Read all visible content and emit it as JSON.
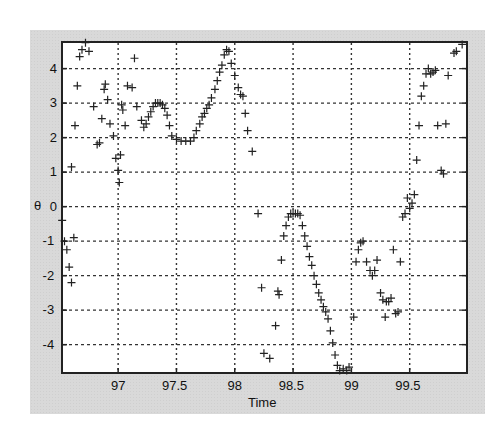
{
  "chart_data": {
    "type": "scatter",
    "title": "",
    "xlabel": "Time",
    "ylabel": "θ",
    "xlim": [
      96.51,
      100.0
    ],
    "ylim": [
      -4.85,
      4.8
    ],
    "xticks": [
      97,
      97.5,
      98,
      98.5,
      99,
      99.5
    ],
    "xtick_labels": [
      "97",
      "97.5",
      "98",
      "98.5",
      "99",
      "99.5"
    ],
    "yticks": [
      -4,
      -3,
      -2,
      -1,
      0,
      1,
      2,
      3,
      4
    ],
    "ytick_labels": [
      "-4",
      "-3",
      "-2",
      "-1",
      "0",
      "1",
      "2",
      "3",
      "4"
    ],
    "grid": true,
    "grid_style": "dotted",
    "marker": "+",
    "marker_color": "#222222",
    "legend": null,
    "series": [
      {
        "name": "theta",
        "points": [
          [
            96.52,
            -0.4
          ],
          [
            96.54,
            -1.0
          ],
          [
            96.56,
            -1.25
          ],
          [
            96.58,
            -1.75
          ],
          [
            96.6,
            -2.2
          ],
          [
            96.62,
            -0.9
          ],
          [
            96.6,
            1.15
          ],
          [
            96.63,
            2.35
          ],
          [
            96.65,
            3.5
          ],
          [
            96.67,
            4.35
          ],
          [
            96.69,
            4.55
          ],
          [
            96.72,
            4.75
          ],
          [
            96.75,
            4.5
          ],
          [
            96.79,
            2.9
          ],
          [
            96.82,
            1.8
          ],
          [
            96.84,
            1.85
          ],
          [
            96.86,
            2.55
          ],
          [
            96.88,
            3.4
          ],
          [
            96.89,
            3.55
          ],
          [
            96.91,
            3.1
          ],
          [
            96.93,
            2.4
          ],
          [
            96.96,
            2.05
          ],
          [
            96.98,
            1.4
          ],
          [
            97.0,
            1.05
          ],
          [
            97.01,
            0.7
          ],
          [
            97.02,
            1.5
          ],
          [
            97.03,
            2.95
          ],
          [
            97.04,
            2.8
          ],
          [
            97.06,
            2.35
          ],
          [
            97.08,
            3.5
          ],
          [
            97.12,
            3.45
          ],
          [
            97.14,
            4.3
          ],
          [
            97.16,
            2.9
          ],
          [
            97.2,
            2.5
          ],
          [
            97.22,
            2.3
          ],
          [
            97.24,
            2.4
          ],
          [
            97.26,
            2.6
          ],
          [
            97.28,
            2.75
          ],
          [
            97.3,
            2.9
          ],
          [
            97.32,
            3.0
          ],
          [
            97.34,
            3.0
          ],
          [
            97.36,
            3.0
          ],
          [
            97.38,
            2.95
          ],
          [
            97.4,
            2.85
          ],
          [
            97.42,
            2.65
          ],
          [
            97.44,
            2.35
          ],
          [
            97.46,
            2.05
          ],
          [
            97.5,
            1.95
          ],
          [
            97.54,
            1.9
          ],
          [
            97.58,
            1.9
          ],
          [
            97.62,
            1.9
          ],
          [
            97.65,
            2.0
          ],
          [
            97.67,
            2.2
          ],
          [
            97.7,
            2.4
          ],
          [
            97.72,
            2.6
          ],
          [
            97.74,
            2.7
          ],
          [
            97.76,
            2.85
          ],
          [
            97.78,
            2.95
          ],
          [
            97.8,
            3.15
          ],
          [
            97.83,
            3.4
          ],
          [
            97.85,
            3.65
          ],
          [
            97.87,
            3.9
          ],
          [
            97.89,
            4.1
          ],
          [
            97.91,
            4.4
          ],
          [
            97.93,
            4.55
          ],
          [
            97.95,
            4.5
          ],
          [
            97.97,
            4.15
          ],
          [
            98.0,
            3.8
          ],
          [
            98.03,
            3.45
          ],
          [
            98.05,
            3.25
          ],
          [
            98.07,
            3.2
          ],
          [
            98.09,
            2.7
          ],
          [
            98.11,
            2.2
          ],
          [
            98.15,
            1.6
          ],
          [
            98.2,
            -0.2
          ],
          [
            98.23,
            -2.35
          ],
          [
            98.25,
            -4.25
          ],
          [
            98.3,
            -4.4
          ],
          [
            98.35,
            -3.45
          ],
          [
            98.37,
            -2.45
          ],
          [
            98.38,
            -2.55
          ],
          [
            98.4,
            -1.55
          ],
          [
            98.42,
            -0.85
          ],
          [
            98.44,
            -0.55
          ],
          [
            98.46,
            -0.3
          ],
          [
            98.48,
            -0.2
          ],
          [
            98.5,
            -0.2
          ],
          [
            98.52,
            -0.2
          ],
          [
            98.54,
            -0.2
          ],
          [
            98.56,
            -0.25
          ],
          [
            98.58,
            -0.55
          ],
          [
            98.6,
            -0.85
          ],
          [
            98.62,
            -1.15
          ],
          [
            98.64,
            -1.45
          ],
          [
            98.66,
            -1.7
          ],
          [
            98.68,
            -2.0
          ],
          [
            98.7,
            -2.25
          ],
          [
            98.72,
            -2.5
          ],
          [
            98.74,
            -2.7
          ],
          [
            98.76,
            -2.9
          ],
          [
            98.78,
            -3.05
          ],
          [
            98.8,
            -3.25
          ],
          [
            98.82,
            -3.6
          ],
          [
            98.84,
            -3.95
          ],
          [
            98.86,
            -4.3
          ],
          [
            98.88,
            -4.6
          ],
          [
            98.9,
            -4.75
          ],
          [
            98.93,
            -4.7
          ],
          [
            98.96,
            -4.75
          ],
          [
            98.98,
            -4.65
          ],
          [
            99.02,
            -3.2
          ],
          [
            99.04,
            -1.6
          ],
          [
            99.06,
            -1.25
          ],
          [
            99.08,
            -1.05
          ],
          [
            99.1,
            -1.0
          ],
          [
            99.13,
            -1.6
          ],
          [
            99.16,
            -1.85
          ],
          [
            99.18,
            -2.0
          ],
          [
            99.2,
            -1.85
          ],
          [
            99.22,
            -1.55
          ],
          [
            99.25,
            -2.5
          ],
          [
            99.27,
            -2.7
          ],
          [
            99.29,
            -3.2
          ],
          [
            99.3,
            -2.75
          ],
          [
            99.32,
            -2.75
          ],
          [
            99.34,
            -2.65
          ],
          [
            99.36,
            -1.25
          ],
          [
            99.38,
            -3.1
          ],
          [
            99.4,
            -3.05
          ],
          [
            99.42,
            -1.6
          ],
          [
            99.44,
            -0.3
          ],
          [
            99.46,
            -0.2
          ],
          [
            99.48,
            0.25
          ],
          [
            99.5,
            -0.05
          ],
          [
            99.52,
            0.1
          ],
          [
            99.54,
            0.35
          ],
          [
            99.56,
            1.35
          ],
          [
            99.58,
            2.35
          ],
          [
            99.6,
            3.2
          ],
          [
            99.62,
            3.5
          ],
          [
            99.64,
            3.85
          ],
          [
            99.66,
            4.0
          ],
          [
            99.68,
            3.85
          ],
          [
            99.7,
            3.9
          ],
          [
            99.72,
            3.95
          ],
          [
            99.74,
            2.35
          ],
          [
            99.77,
            1.05
          ],
          [
            99.79,
            0.95
          ],
          [
            99.81,
            2.4
          ],
          [
            99.83,
            3.8
          ],
          [
            99.88,
            4.45
          ],
          [
            99.9,
            4.5
          ],
          [
            99.95,
            4.7
          ]
        ]
      }
    ]
  }
}
